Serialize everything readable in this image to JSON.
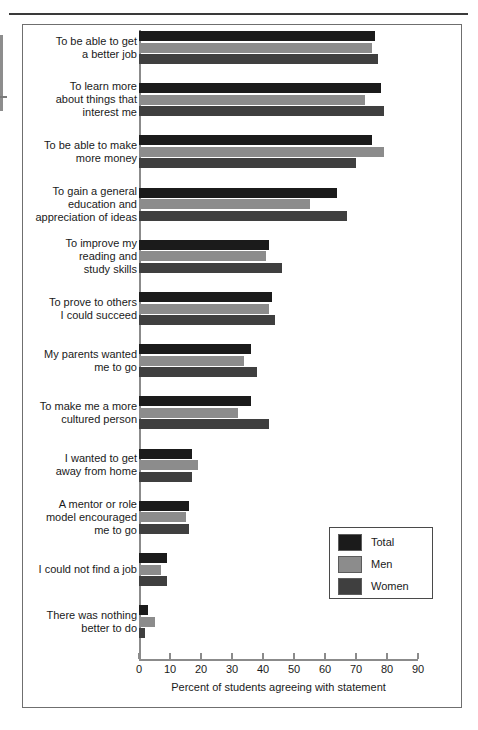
{
  "chart_data": {
    "type": "bar",
    "orientation": "horizontal",
    "title": "",
    "xlabel": "Percent of students agreeing with statement",
    "ylabel": "",
    "xlim": [
      0,
      90
    ],
    "xticks": [
      0,
      10,
      20,
      30,
      40,
      50,
      60,
      70,
      80,
      90
    ],
    "grid": false,
    "legend_position": "bottom-right",
    "categories": [
      "To be able to get a better job",
      "To learn more about things that interest me",
      "To be able to make more money",
      "To gain a general education and appreciation of ideas",
      "To improve my reading and study skills",
      "To prove to others I could succeed",
      "My parents wanted me to go",
      "To make me a more cultured person",
      "I wanted to get away from home",
      "A mentor or role model encouraged me to go",
      "I could not find a job",
      "There was nothing better to do"
    ],
    "category_lines": [
      [
        "To be able to get",
        "a better job"
      ],
      [
        "To learn more",
        "about things that",
        "interest me"
      ],
      [
        "To be able to make",
        "more money"
      ],
      [
        "To gain a general",
        "education and",
        "appreciation of ideas"
      ],
      [
        "To improve my",
        "reading and",
        "study skills"
      ],
      [
        "To prove to others",
        "I could succeed"
      ],
      [
        "My parents wanted",
        "me to go"
      ],
      [
        "To make me a more",
        "cultured person"
      ],
      [
        "I wanted to get",
        "away from home"
      ],
      [
        "A mentor or role",
        "model encouraged",
        "me to go"
      ],
      [
        "I could not find a job"
      ],
      [
        "There was nothing",
        "better to do"
      ]
    ],
    "series": [
      {
        "name": "Total",
        "color": "#1b1b1b",
        "values": [
          76,
          78,
          75,
          64,
          42,
          43,
          36,
          36,
          17,
          16,
          9,
          3
        ]
      },
      {
        "name": "Men",
        "color": "#8c8c8c",
        "values": [
          75,
          73,
          79,
          55,
          41,
          42,
          34,
          32,
          19,
          15,
          7,
          5
        ]
      },
      {
        "name": "Women",
        "color": "#3f3f3f",
        "values": [
          77,
          79,
          70,
          67,
          46,
          44,
          38,
          42,
          17,
          16,
          9,
          2
        ]
      }
    ]
  },
  "axis": {
    "tick_labels": [
      "0",
      "10",
      "20",
      "30",
      "40",
      "50",
      "60",
      "70",
      "80",
      "90"
    ],
    "x_title": "Percent of students agreeing with statement"
  },
  "legend": {
    "items": [
      {
        "label": "Total",
        "color": "#1b1b1b"
      },
      {
        "label": "Men",
        "color": "#8c8c8c"
      },
      {
        "label": "Women",
        "color": "#3f3f3f"
      }
    ]
  }
}
